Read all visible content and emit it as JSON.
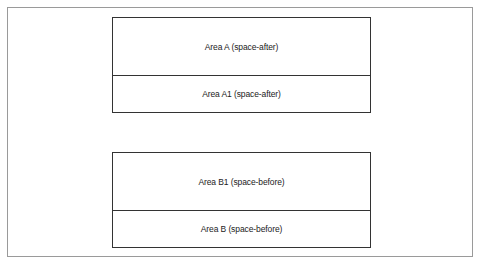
{
  "diagram": {
    "group_a": {
      "areas": [
        {
          "label": "Area A (space-after)"
        },
        {
          "label": "Area A1 (space-after)"
        }
      ]
    },
    "group_b": {
      "areas": [
        {
          "label": "Area B1 (space-before)"
        },
        {
          "label": "Area B (space-before)"
        }
      ]
    }
  },
  "colors": {
    "border": "#333333",
    "frame": "#9a9a9a",
    "background": "#ffffff"
  }
}
